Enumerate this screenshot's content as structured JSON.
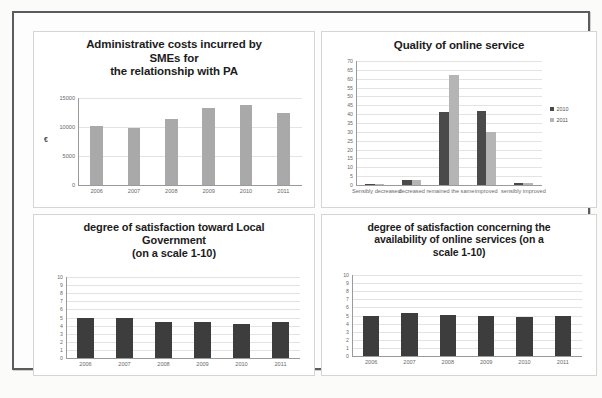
{
  "document": {
    "kind": "scanned-figure-sheet",
    "panel_count": 4
  },
  "charts": [
    {
      "id": "administrative-costs",
      "title_lines": [
        "Administrative costs incurred by",
        "SMEs for",
        "the relationship with PA"
      ],
      "axis_unit": "€"
    },
    {
      "id": "quality-of-online-service",
      "title_lines": [
        "Quality of online service"
      ]
    },
    {
      "id": "satisfaction-local-government",
      "title_lines": [
        "degree of satisfaction toward Local",
        "Government",
        "(on a scale 1-10)"
      ]
    },
    {
      "id": "satisfaction-online-availability",
      "title_lines": [
        "degree of satisfaction  concerning the",
        "availability of online services (on a",
        "scale 1-10)"
      ]
    }
  ],
  "chart_data": [
    {
      "type": "bar",
      "id": "administrative-costs",
      "title": "Administrative costs incurred by SMEs for the relationship with PA",
      "xlabel": "",
      "ylabel": "€",
      "categories": [
        "2006",
        "2007",
        "2008",
        "2009",
        "2010",
        "2011"
      ],
      "values": [
        10200,
        9900,
        11300,
        13200,
        13800,
        12500
      ],
      "ylim": [
        0,
        15000
      ],
      "yticks": [
        "0",
        "5000",
        "10000",
        "15000"
      ],
      "ytick_values": [
        0,
        5000,
        10000,
        15000
      ],
      "grid": true,
      "legend": "none",
      "bar_color": "#a9a9a9"
    },
    {
      "type": "bar",
      "id": "quality-of-online-service",
      "title": "Quality of online service",
      "xlabel": "",
      "ylabel": "",
      "categories": [
        "Sensibly decreased",
        "decreased",
        "remained the same",
        "improved",
        "sensibly improved"
      ],
      "series": [
        {
          "name": "2010",
          "values": [
            0,
            3,
            41,
            42,
            1
          ],
          "color": "#4a4a4a"
        },
        {
          "name": "2011",
          "values": [
            0,
            3,
            62,
            30,
            1
          ],
          "color": "#b5b5b5"
        }
      ],
      "ylim": [
        0,
        70
      ],
      "yticks": [
        "70",
        "65",
        "60",
        "55",
        "50",
        "45",
        "40",
        "35",
        "30",
        "25",
        "20",
        "15",
        "10",
        "5",
        "0"
      ],
      "ytick_values": [
        70,
        65,
        60,
        55,
        50,
        45,
        40,
        35,
        30,
        25,
        20,
        15,
        10,
        5,
        0
      ],
      "grid": true,
      "legend": "right",
      "legend_entries": [
        "2010",
        "2011"
      ]
    },
    {
      "type": "bar",
      "id": "satisfaction-local-government",
      "title": "degree of satisfaction toward Local Government (on a scale 1-10)",
      "xlabel": "",
      "ylabel": "",
      "categories": [
        "2006",
        "2007",
        "2008",
        "2009",
        "2010",
        "2011"
      ],
      "values": [
        4.9,
        4.9,
        4.4,
        4.4,
        4.2,
        4.4
      ],
      "ylim": [
        0,
        10
      ],
      "yticks": [
        "10",
        "9",
        "8",
        "7",
        "6",
        "5",
        "4",
        "3",
        "2",
        "1",
        "0"
      ],
      "ytick_values": [
        10,
        9,
        8,
        7,
        6,
        5,
        4,
        3,
        2,
        1,
        0
      ],
      "grid": true,
      "legend": "none",
      "bar_color": "#3d3d3d"
    },
    {
      "type": "bar",
      "id": "satisfaction-online-availability",
      "title": "degree of satisfaction concerning the availability of online services (on a scale 1-10)",
      "xlabel": "",
      "ylabel": "",
      "categories": [
        "2006",
        "2007",
        "2008",
        "2009",
        "2010",
        "2011"
      ],
      "values": [
        5.0,
        5.3,
        5.1,
        5.0,
        4.8,
        5.0
      ],
      "ylim": [
        0,
        10
      ],
      "yticks": [
        "10",
        "9",
        "8",
        "7",
        "6",
        "5",
        "4",
        "3",
        "2",
        "1",
        "0"
      ],
      "ytick_values": [
        10,
        9,
        8,
        7,
        6,
        5,
        4,
        3,
        2,
        1,
        0
      ],
      "grid": true,
      "legend": "none",
      "bar_color": "#3d3d3d"
    }
  ],
  "colors": {
    "series_2010": "#4a4a4a",
    "series_2011": "#b5b5b5",
    "bar_light": "#a9a9a9",
    "bar_dark": "#3d3d3d",
    "frame": "#5c5c5c",
    "gridline": "#e3e3e3",
    "axis": "#9a9a9a"
  }
}
